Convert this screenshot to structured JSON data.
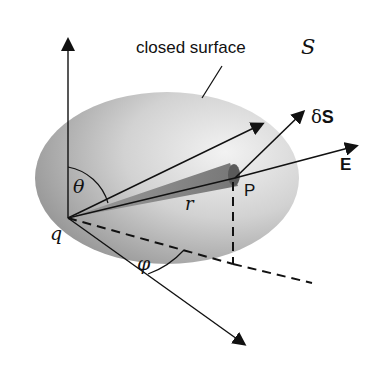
{
  "diagram": {
    "caption_label": "closed surface",
    "surface_symbol": "S",
    "charge_label": "q",
    "point_label": "P",
    "radius_label": "r",
    "theta_label": "θ",
    "phi_label": "φ",
    "area_vector_label": "δS",
    "field_label": "E",
    "colors": {
      "ink": "#111111",
      "surface_dark": "#8a8a8a",
      "surface_light": "#e6e6e6",
      "cone": "#7a7a7a"
    }
  }
}
